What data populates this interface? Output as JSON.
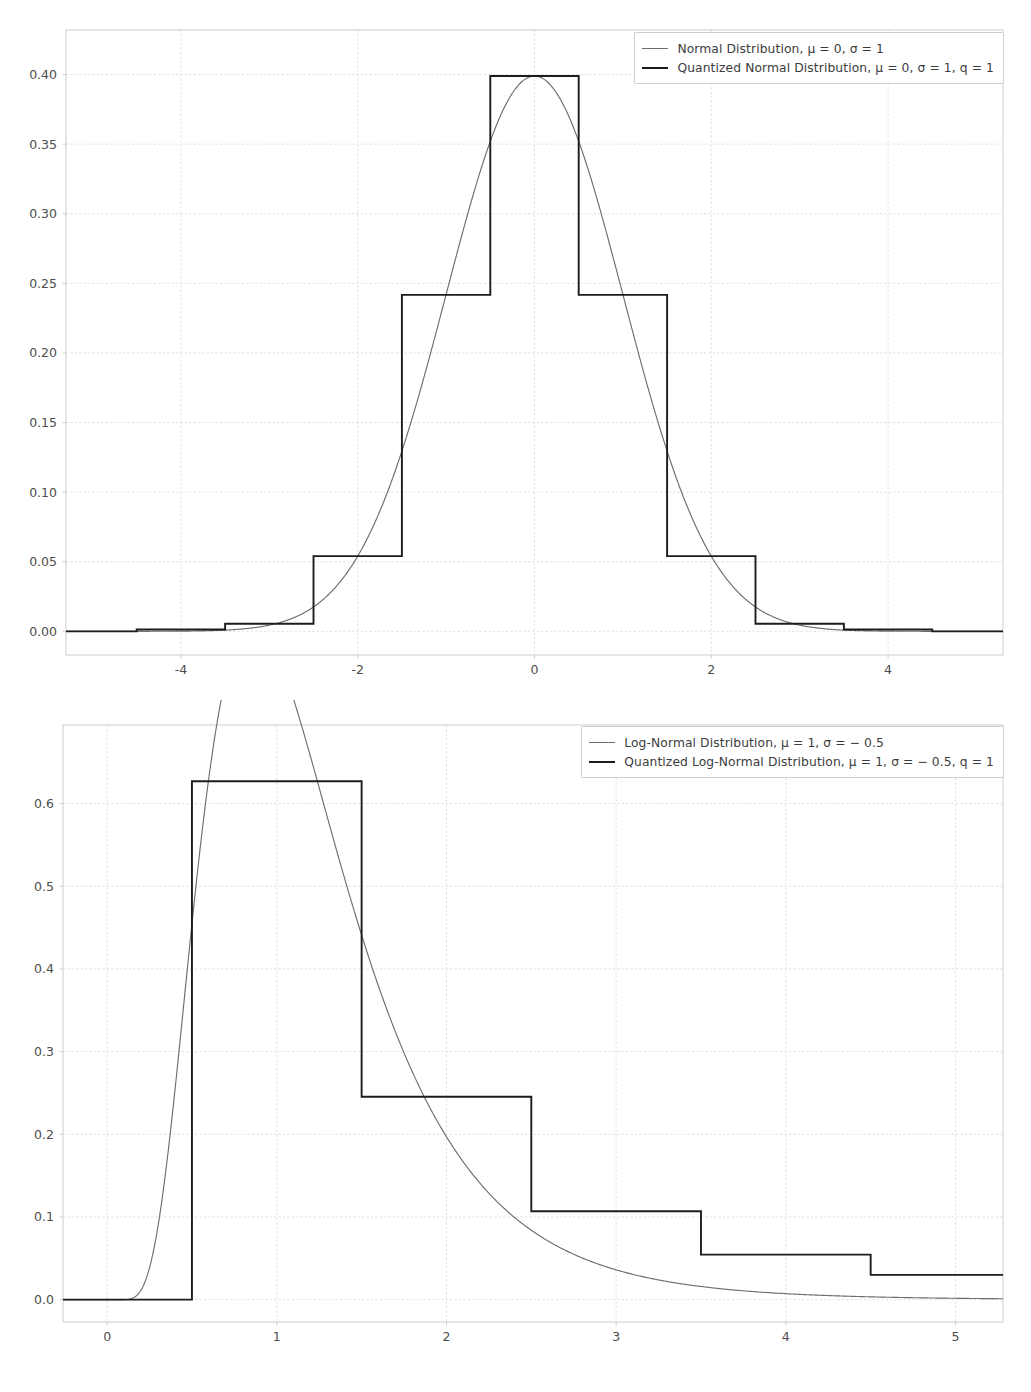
{
  "figure": {
    "background": "#ffffff",
    "panels": 2
  },
  "colors": {
    "continuous_curve": "#6e6e6e",
    "quantized_curve": "#1c1c1c",
    "grid": "#d8d8d8",
    "axis": "#c8c8c8",
    "tick_text": "#4d4d4d"
  },
  "chart_data": [
    {
      "type": "line",
      "id": "normal-quantization",
      "title": "",
      "xlabel": "",
      "ylabel": "",
      "xlim": [
        -5.3,
        5.3
      ],
      "ylim": [
        -0.017,
        0.432
      ],
      "grid": true,
      "legend_position": "upper right",
      "xticks": [
        -4,
        -2,
        0,
        2,
        4
      ],
      "xtick_labels": [
        "-4",
        "-2",
        "0",
        "2",
        "4"
      ],
      "yticks": [
        0.0,
        0.05,
        0.1,
        0.15,
        0.2,
        0.25,
        0.3,
        0.35,
        0.4
      ],
      "ytick_labels": [
        "0.00",
        "0.05",
        "0.10",
        "0.15",
        "0.20",
        "0.25",
        "0.30",
        "0.35",
        "0.40"
      ],
      "series": [
        {
          "name": "Normal Distribution, μ = 0, σ = 1",
          "style": "thin",
          "kind": "pdf-normal",
          "mu": 0,
          "sigma": 1,
          "peak": 0.3989
        },
        {
          "name": "Quantized Normal Distribution, μ = 0, σ = 1, q = 1",
          "style": "thick",
          "kind": "step",
          "q": 1,
          "step_edges": [
            -5.3,
            -4.5,
            -3.5,
            -2.5,
            -1.5,
            -0.5,
            0.5,
            1.5,
            2.5,
            3.5,
            4.5,
            5.3
          ],
          "step_values": [
            0.0,
            0.0013,
            0.0054,
            0.054,
            0.2417,
            0.3989,
            0.2417,
            0.054,
            0.0054,
            0.0013,
            0.0
          ]
        }
      ]
    },
    {
      "type": "line",
      "id": "lognormal-quantization",
      "title": "",
      "xlabel": "",
      "ylabel": "",
      "xlim": [
        -0.26,
        5.28
      ],
      "ylim": [
        -0.027,
        0.695
      ],
      "grid": true,
      "legend_position": "upper right",
      "xticks": [
        0,
        1,
        2,
        3,
        4,
        5
      ],
      "xtick_labels": [
        "0",
        "1",
        "2",
        "3",
        "4",
        "5"
      ],
      "yticks": [
        0.0,
        0.1,
        0.2,
        0.3,
        0.4,
        0.5,
        0.6
      ],
      "ytick_labels": [
        "0.0",
        "0.1",
        "0.2",
        "0.3",
        "0.4",
        "0.5",
        "0.6"
      ],
      "series": [
        {
          "name": "Log-Normal Distribution, μ = 1, σ = −0.5",
          "style": "thin",
          "kind": "pdf-lognormal",
          "mu": 1,
          "sigma": -0.5,
          "peak": 0.657,
          "peak_x": 0.86
        },
        {
          "name": "Quantized Log-Normal Distribution, μ = 1, σ = −0.5, q = 1",
          "style": "thick",
          "kind": "step",
          "q": 1,
          "step_edges": [
            -0.26,
            0.5,
            1.5,
            2.5,
            3.5,
            4.5,
            5.28
          ],
          "step_values": [
            0.0,
            0.627,
            0.2455,
            0.107,
            0.0545,
            0.03
          ]
        }
      ]
    }
  ],
  "legends": {
    "top": {
      "entries": [
        {
          "label": "Normal Distribution, μ = 0, σ = 1",
          "style": "thin"
        },
        {
          "label": "Quantized Normal Distribution, μ = 0, σ = 1, q = 1",
          "style": "thick"
        }
      ]
    },
    "bottom": {
      "entries": [
        {
          "label": "Log-Normal Distribution, μ = 1, σ = − 0.5",
          "style": "thin"
        },
        {
          "label": "Quantized Log-Normal Distribution, μ = 1, σ = − 0.5, q = 1",
          "style": "thick"
        }
      ]
    }
  }
}
